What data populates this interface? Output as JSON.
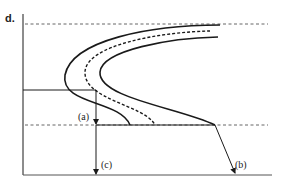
{
  "diagram": {
    "y_axis_label": "d.",
    "labels": {
      "a": "(a)",
      "b": "(b)",
      "c": "(c)"
    },
    "colors": {
      "line": "#1a1a1a",
      "dashed": "#555555",
      "background": "#ffffff"
    },
    "elements": {
      "axes": "L-shaped axes: vertical left axis and horizontal bottom axis",
      "top_dashed_line": "horizontal dashed reference at top",
      "mid_dashed_line": "horizontal dashed reference at middle",
      "curves": [
        "outer solid C-curve",
        "middle dashed C-curve",
        "inner solid C-curve"
      ],
      "arrows": [
        "(a) down to mid line",
        "(c) down to bottom axis",
        "(b) diagonal down-right from curve tip"
      ]
    }
  }
}
